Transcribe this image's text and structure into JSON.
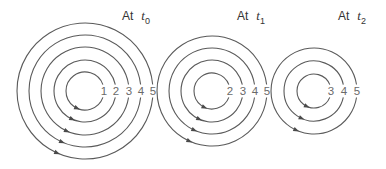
{
  "figure": {
    "colors": {
      "line": "#5a5a5a",
      "text": "#333333",
      "numerals": "#6a6a6a"
    },
    "panels": [
      {
        "label_prefix": "At",
        "label_var": "t",
        "label_sub": "0",
        "label_pos": [
          122,
          8
        ],
        "center": [
          85,
          91
        ],
        "rings": [
          {
            "id": "1",
            "r": 19
          },
          {
            "id": "2",
            "r": 31
          },
          {
            "id": "3",
            "r": 44
          },
          {
            "id": "4",
            "r": 56
          },
          {
            "id": "5",
            "r": 68
          }
        ],
        "arrow_direction": "counterclockwise"
      },
      {
        "label_prefix": "At",
        "label_var": "t",
        "label_sub": "1",
        "label_pos": [
          237,
          8
        ],
        "center": [
          212,
          91
        ],
        "rings": [
          {
            "id": "2",
            "r": 18
          },
          {
            "id": "3",
            "r": 31
          },
          {
            "id": "4",
            "r": 43
          },
          {
            "id": "5",
            "r": 55
          }
        ],
        "arrow_direction": "counterclockwise"
      },
      {
        "label_prefix": "At",
        "label_var": "t",
        "label_sub": "2",
        "label_pos": [
          338,
          8
        ],
        "center": [
          314,
          91
        ],
        "rings": [
          {
            "id": "3",
            "r": 17
          },
          {
            "id": "4",
            "r": 30
          },
          {
            "id": "5",
            "r": 43
          }
        ],
        "arrow_direction": "counterclockwise"
      }
    ]
  }
}
